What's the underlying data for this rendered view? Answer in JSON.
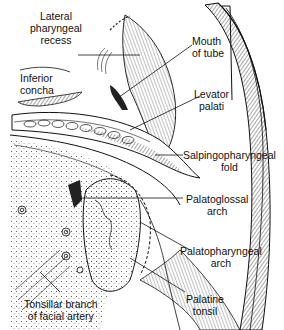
{
  "figure": {
    "style": "pen-and-ink anatomical line drawing"
  },
  "labels": {
    "lateral_pharyngeal_recess": {
      "line1": "Lateral",
      "line2": "pharyngeal",
      "line3": "recess"
    },
    "inferior_concha": {
      "line1": "Inferior",
      "line2": "concha"
    },
    "mouth_of_tube": {
      "line1": "Mouth",
      "line2": "of tube"
    },
    "levator_palati": {
      "line1": "Levator",
      "line2": "palati"
    },
    "salpingopharyngeal_fold": {
      "line1": "Salpingopharyngeal",
      "line2": "fold"
    },
    "palatoglossal_arch": {
      "line1": "Palatoglossal",
      "line2": "arch"
    },
    "palatopharyngeal_arch": {
      "line1": "Palatopharyngeal",
      "line2": "arch"
    },
    "palatine_tonsil": {
      "line1": "Palatine",
      "line2": "tonsil"
    },
    "tonsillar_branch": {
      "line1": "Tonsillar branch",
      "line2": "of facial artery"
    }
  },
  "colors": {
    "ink": "#111111",
    "paper": "#ffffff"
  }
}
